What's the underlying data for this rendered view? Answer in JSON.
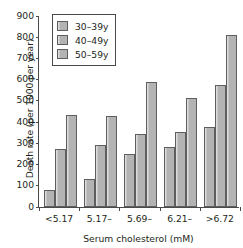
{
  "chart_data": {
    "type": "bar",
    "title": "",
    "xlabel": "Serum cholesterol (mM)",
    "ylabel": "Death rate (per 1000 per year)",
    "categories": [
      "<5.17",
      "5.17–",
      "5.69–",
      "6.21–",
      ">6.72"
    ],
    "series": [
      {
        "name": "30–39y",
        "values": [
          79,
          132,
          250,
          282,
          378
        ]
      },
      {
        "name": "40–49y",
        "values": [
          272,
          290,
          342,
          355,
          575
        ]
      },
      {
        "name": "50–59y",
        "values": [
          435,
          430,
          587,
          515,
          810
        ]
      }
    ],
    "ylim": [
      0,
      900
    ],
    "ytick_labels": [
      "0",
      "100",
      "200",
      "300",
      "400",
      "500",
      "600",
      "700",
      "800",
      "900"
    ],
    "ytick_values": [
      0,
      100,
      200,
      300,
      400,
      500,
      600,
      700,
      800,
      900
    ],
    "grid": false,
    "legend_position": "top-left",
    "colors": {
      "bar_fill": "#b3b3b3",
      "bar_edge": "#5e5e5e",
      "bar_highlight": "#dcdcdc",
      "axis": "#4a4a4a",
      "text": "#231f20",
      "background": "#ffffff"
    }
  }
}
